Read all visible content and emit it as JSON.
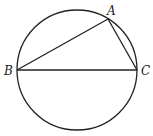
{
  "diagram": {
    "type": "geometry",
    "circle": {
      "cx": 77,
      "cy": 70,
      "r": 60
    },
    "points": {
      "A": {
        "label": "A",
        "x": 108,
        "y": 19,
        "label_x": 107,
        "label_y": 15
      },
      "B": {
        "label": "B",
        "x": 17,
        "y": 70,
        "label_x": 4,
        "label_y": 75
      },
      "C": {
        "label": "C",
        "x": 137,
        "y": 70,
        "label_x": 141,
        "label_y": 75
      }
    },
    "segments": [
      [
        "B",
        "A"
      ],
      [
        "A",
        "C"
      ],
      [
        "B",
        "C"
      ]
    ],
    "stroke_color": "#222222"
  }
}
